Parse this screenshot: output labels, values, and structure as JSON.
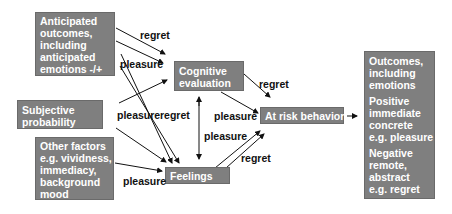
{
  "boxes": {
    "anticipated": {
      "lines": [
        "Anticipated",
        "outcomes,",
        "including",
        "anticipated",
        "emotions -/+"
      ]
    },
    "subjective": {
      "lines": [
        "Subjective",
        "probability"
      ]
    },
    "other": {
      "lines": [
        "Other factors",
        "e.g. vividness,",
        "immediacy,",
        "background",
        "mood"
      ]
    },
    "cognitive": {
      "lines": [
        "Cognitive",
        "evaluation"
      ]
    },
    "feelings": {
      "label": "Feelings"
    },
    "atrisk": {
      "label": "At risk behavior"
    },
    "outcomes": {
      "para1": [
        "Outcomes,",
        "including",
        "emotions"
      ],
      "para2": [
        "Positive",
        "immediate",
        "concrete",
        "e.g. pleasure"
      ],
      "para3": [
        "Negative",
        "remote,",
        "abstract",
        "e.g. regret"
      ]
    }
  },
  "labels": {
    "regret_top": "regret",
    "pleasure_top": "pleasure",
    "pleasure_mid": "pleasure",
    "regret_mid": "regret",
    "regret_cog_risk": "regret",
    "pleasure_cog_risk": "pleasure",
    "pleasure_feel_risk": "pleasure",
    "regret_feel_risk": "regret",
    "pleasure_other_feel": "pleasure"
  },
  "colors": {
    "box_fill": "#7f7f7f",
    "box_text": "#ffffff",
    "label_text": "#111111",
    "arrow": "#111111"
  }
}
